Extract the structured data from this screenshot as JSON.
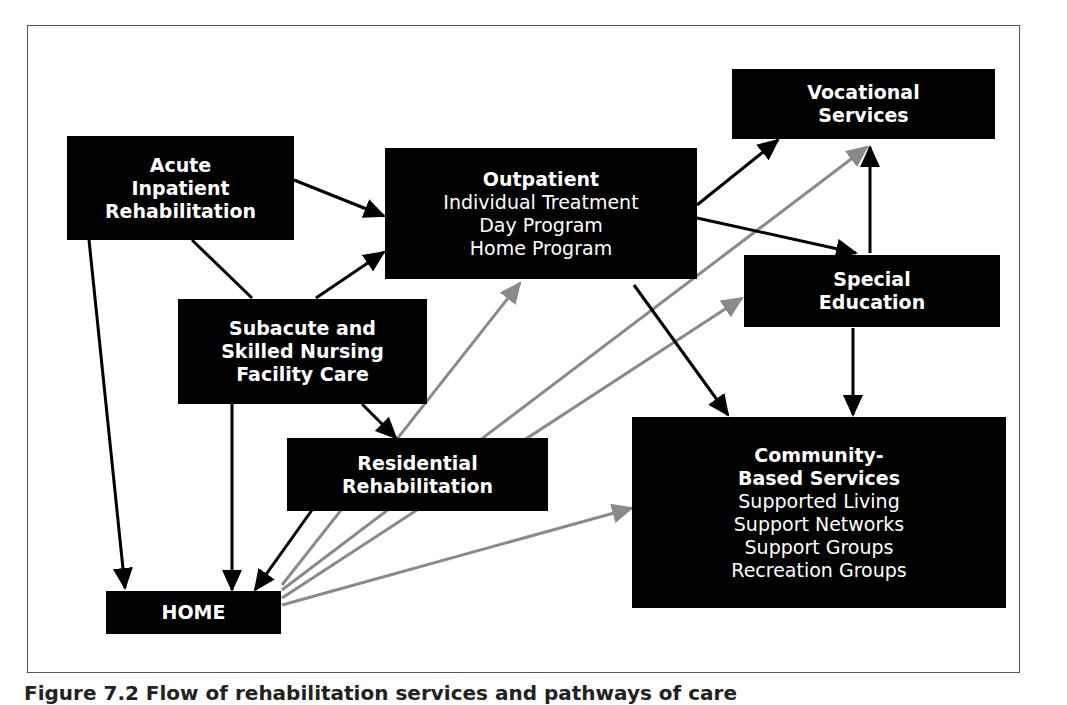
{
  "colors": {
    "node_bg": "#000000",
    "node_text": "#ffffff",
    "arrow_black": "#000000",
    "arrow_gray": "#8a8a8a",
    "frame": "#555555"
  },
  "nodes": {
    "acute": {
      "title_lines": [
        "Acute",
        "Inpatient",
        "Rehabilitation"
      ]
    },
    "outpatient": {
      "title": "Outpatient",
      "items": [
        "Individual Treatment",
        "Day Program",
        "Home Program"
      ]
    },
    "vocational": {
      "title_lines": [
        "Vocational",
        "Services"
      ]
    },
    "special_ed": {
      "title_lines": [
        "Special",
        "Education"
      ]
    },
    "subacute": {
      "title_lines": [
        "Subacute and",
        "Skilled Nursing",
        "Facility Care"
      ]
    },
    "residential": {
      "title_lines": [
        "Residential",
        "Rehabilitation"
      ]
    },
    "community": {
      "title_lines": [
        "Community-",
        "Based Services"
      ],
      "items": [
        "Supported Living",
        "Support Networks",
        "Support Groups",
        "Recreation Groups"
      ]
    },
    "home": {
      "title": "HOME"
    }
  },
  "edges": [
    {
      "from": "Acute Inpatient Rehabilitation",
      "to": "Outpatient",
      "color": "black"
    },
    {
      "from": "Acute Inpatient Rehabilitation",
      "to": "HOME",
      "color": "black"
    },
    {
      "from": "Subacute and Skilled Nursing Facility Care",
      "to": "Outpatient",
      "color": "black"
    },
    {
      "from": "Subacute and Skilled Nursing Facility Care",
      "to": "Residential Rehabilitation",
      "color": "black"
    },
    {
      "from": "Subacute and Skilled Nursing Facility Care",
      "to": "HOME",
      "color": "black"
    },
    {
      "from": "Outpatient",
      "to": "Vocational Services",
      "color": "black"
    },
    {
      "from": "Outpatient",
      "to": "Special Education",
      "color": "black"
    },
    {
      "from": "Outpatient",
      "to": "Community-Based Services",
      "color": "black"
    },
    {
      "from": "Special Education",
      "to": "Vocational Services",
      "color": "black"
    },
    {
      "from": "Special Education",
      "to": "Community-Based Services",
      "color": "black"
    },
    {
      "from": "Residential Rehabilitation",
      "to": "HOME",
      "color": "black"
    },
    {
      "from": "HOME",
      "to": "Outpatient",
      "color": "gray"
    },
    {
      "from": "HOME",
      "to": "Vocational Services",
      "color": "gray"
    },
    {
      "from": "HOME",
      "to": "Special Education",
      "color": "gray"
    },
    {
      "from": "HOME",
      "to": "Community-Based Services",
      "color": "gray"
    }
  ],
  "caption": "Figure 7.2  Flow of rehabilitation services and pathways of care"
}
